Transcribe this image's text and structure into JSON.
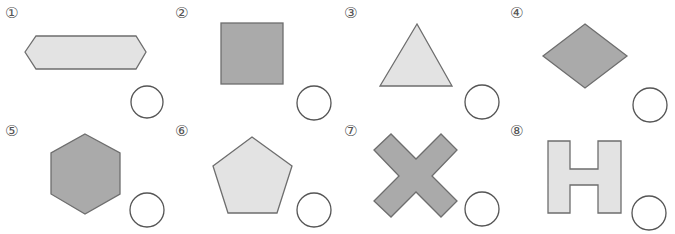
{
  "colors": {
    "dark_fill": "#aaaaaa",
    "light_fill": "#e3e3e3",
    "stroke": "#6e6e6e",
    "circle_stroke": "#555555"
  },
  "items": [
    {
      "number": "①",
      "shape": "elongated-hexagon",
      "fill": "light"
    },
    {
      "number": "②",
      "shape": "square",
      "fill": "dark"
    },
    {
      "number": "③",
      "shape": "triangle",
      "fill": "light"
    },
    {
      "number": "④",
      "shape": "rhombus",
      "fill": "dark"
    },
    {
      "number": "⑤",
      "shape": "hexagon",
      "fill": "dark"
    },
    {
      "number": "⑥",
      "shape": "pentagon",
      "fill": "light"
    },
    {
      "number": "⑦",
      "shape": "x-cross",
      "fill": "dark"
    },
    {
      "number": "⑧",
      "shape": "h-shape",
      "fill": "light"
    }
  ]
}
